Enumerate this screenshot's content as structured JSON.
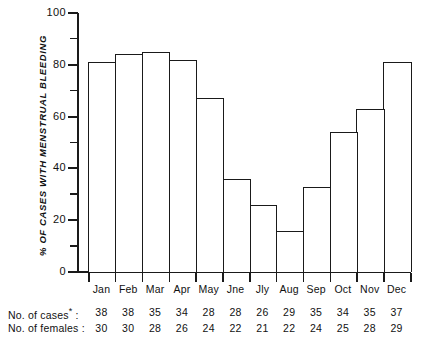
{
  "chart_data": {
    "type": "bar",
    "title": "",
    "xlabel": "",
    "ylabel": "% OF CASES WITH MENSTRUAL BLEEDING",
    "ylim": [
      0,
      100
    ],
    "yticks": [
      0,
      20,
      40,
      60,
      80,
      100
    ],
    "ytick_labels": [
      "0",
      "20",
      "40",
      "60",
      "80",
      "100"
    ],
    "minor_yticks": [
      10,
      30,
      50,
      70,
      90
    ],
    "grid": false,
    "legend": null,
    "categories": [
      "Jan",
      "Feb",
      "Mar",
      "Apr",
      "May",
      "Jne",
      "Jly",
      "Aug",
      "Sep",
      "Oct",
      "Nov",
      "Dec"
    ],
    "values": [
      81,
      84,
      85,
      82,
      67,
      36,
      26,
      16,
      33,
      54,
      63,
      81
    ],
    "bar_style": {
      "fill": "#ffffff",
      "edge": "#1a1a1a",
      "gap": 0
    },
    "annotations": {
      "cases_row_label": "No. of cases",
      "cases_row_star": "*",
      "cases_row_colon": ":",
      "females_row_label": "No. of females",
      "females_row_colon": ":",
      "cases": [
        38,
        38,
        35,
        34,
        28,
        28,
        26,
        29,
        35,
        34,
        35,
        37
      ],
      "females": [
        30,
        30,
        28,
        26,
        24,
        22,
        21,
        22,
        24,
        25,
        28,
        29
      ]
    }
  }
}
